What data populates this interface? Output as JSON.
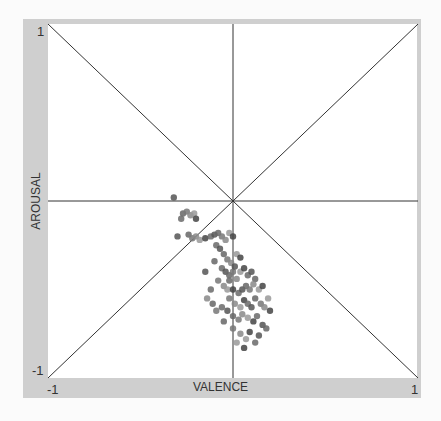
{
  "chart_data": {
    "type": "scatter",
    "title": "",
    "xlabel": "VALENCE",
    "ylabel": "AROUSAL",
    "xlim": [
      -1,
      1
    ],
    "ylim": [
      -1,
      1
    ],
    "tick_labels": {
      "x_min": "-1",
      "x_max": "1",
      "y_min": "-1",
      "y_max": "1"
    },
    "grid": "center crosshair plus two diagonals",
    "points": [
      [
        -0.32,
        0.02
      ],
      [
        -0.27,
        -0.07
      ],
      [
        -0.25,
        -0.06
      ],
      [
        -0.23,
        -0.08
      ],
      [
        -0.21,
        -0.07
      ],
      [
        -0.2,
        -0.1
      ],
      [
        -0.28,
        -0.1
      ],
      [
        -0.3,
        -0.2
      ],
      [
        -0.24,
        -0.19
      ],
      [
        -0.22,
        -0.21
      ],
      [
        -0.2,
        -0.2
      ],
      [
        -0.18,
        -0.22
      ],
      [
        -0.15,
        -0.21
      ],
      [
        -0.12,
        -0.2
      ],
      [
        -0.1,
        -0.19
      ],
      [
        -0.08,
        -0.18
      ],
      [
        -0.06,
        -0.2
      ],
      [
        -0.04,
        -0.22
      ],
      [
        -0.02,
        -0.18
      ],
      [
        0.0,
        -0.2
      ],
      [
        -0.09,
        -0.25
      ],
      [
        -0.07,
        -0.27
      ],
      [
        -0.05,
        -0.3
      ],
      [
        -0.03,
        -0.33
      ],
      [
        -0.01,
        -0.35
      ],
      [
        0.02,
        -0.3
      ],
      [
        0.04,
        -0.32
      ],
      [
        -0.06,
        -0.38
      ],
      [
        -0.04,
        -0.4
      ],
      [
        -0.02,
        -0.42
      ],
      [
        0.0,
        -0.4
      ],
      [
        0.02,
        -0.44
      ],
      [
        0.04,
        -0.4
      ],
      [
        0.06,
        -0.38
      ],
      [
        0.08,
        -0.42
      ],
      [
        0.1,
        -0.4
      ],
      [
        0.12,
        -0.44
      ],
      [
        -0.08,
        -0.45
      ],
      [
        -0.05,
        -0.48
      ],
      [
        -0.03,
        -0.5
      ],
      [
        0.0,
        -0.5
      ],
      [
        0.03,
        -0.52
      ],
      [
        0.05,
        -0.5
      ],
      [
        0.07,
        -0.48
      ],
      [
        0.09,
        -0.5
      ],
      [
        0.11,
        -0.47
      ],
      [
        0.14,
        -0.5
      ],
      [
        0.16,
        -0.48
      ],
      [
        -0.12,
        -0.5
      ],
      [
        -0.15,
        -0.4
      ],
      [
        -0.1,
        -0.34
      ],
      [
        -0.02,
        -0.55
      ],
      [
        0.01,
        -0.58
      ],
      [
        0.04,
        -0.6
      ],
      [
        0.06,
        -0.56
      ],
      [
        0.08,
        -0.58
      ],
      [
        0.1,
        -0.6
      ],
      [
        0.12,
        -0.55
      ],
      [
        0.15,
        -0.58
      ],
      [
        0.17,
        -0.6
      ],
      [
        0.19,
        -0.55
      ],
      [
        0.2,
        -0.62
      ],
      [
        -0.06,
        -0.6
      ],
      [
        -0.03,
        -0.62
      ],
      [
        0.0,
        -0.65
      ],
      [
        0.03,
        -0.67
      ],
      [
        0.05,
        -0.64
      ],
      [
        0.08,
        -0.66
      ],
      [
        0.11,
        -0.68
      ],
      [
        0.13,
        -0.65
      ],
      [
        0.16,
        -0.7
      ],
      [
        0.18,
        -0.72
      ],
      [
        0.0,
        -0.72
      ],
      [
        0.04,
        -0.75
      ],
      [
        0.07,
        -0.78
      ],
      [
        0.09,
        -0.74
      ],
      [
        0.12,
        -0.8
      ],
      [
        0.14,
        -0.76
      ],
      [
        -0.05,
        -0.68
      ],
      [
        -0.09,
        -0.62
      ],
      [
        -0.14,
        -0.55
      ],
      [
        0.02,
        -0.8
      ],
      [
        0.06,
        -0.83
      ],
      [
        -0.02,
        -0.45
      ],
      [
        0.01,
        -0.37
      ],
      [
        -0.11,
        -0.58
      ]
    ]
  }
}
